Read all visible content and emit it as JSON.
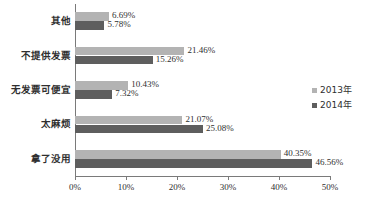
{
  "chart_data": {
    "type": "bar",
    "orientation": "horizontal",
    "title": "",
    "xlabel": "",
    "ylabel": "",
    "xlim": [
      0,
      50
    ],
    "grid": false,
    "legend_position": "right",
    "categories": [
      "其他",
      "不提供发票",
      "无发票可便宜",
      "太麻烦",
      "拿了没用"
    ],
    "tick_labels": [
      "0%",
      "10%",
      "20%",
      "30%",
      "40%",
      "50%"
    ],
    "tick_values": [
      0,
      10,
      20,
      30,
      40,
      50
    ],
    "series": [
      {
        "name": "2013年",
        "color": "#b3b3b3",
        "values": [
          6.69,
          21.46,
          10.43,
          21.07,
          40.35
        ],
        "labels": [
          "6.69%",
          "21.46%",
          "10.43%",
          "21.07%",
          "40.35%"
        ]
      },
      {
        "name": "2014年",
        "color": "#5e5e5e",
        "values": [
          5.78,
          15.26,
          7.32,
          25.08,
          46.56
        ],
        "labels": [
          "5.78%",
          "15.26%",
          "7.32%",
          "25.08%",
          "46.56%"
        ]
      }
    ]
  },
  "legend": {
    "items": [
      {
        "label": "2013年",
        "marker": "square-marker",
        "color": "#b3b3b3"
      },
      {
        "label": "2014年",
        "marker": "square-marker",
        "color": "#5e5e5e"
      }
    ]
  }
}
